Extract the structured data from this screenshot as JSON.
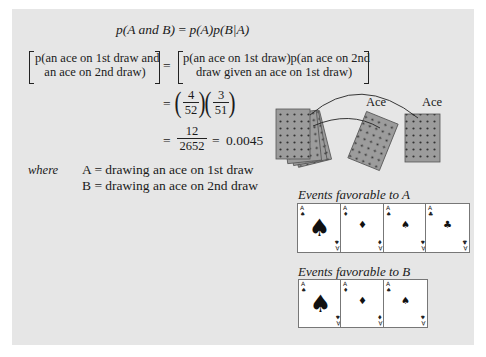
{
  "formula": {
    "general": {
      "lhs": "p(A and B)",
      "eq": "=",
      "rhs": "p(A)p(B|A)"
    },
    "bracketed": {
      "lhs_line1": "p(an ace on 1st draw and",
      "lhs_line2": "an ace on 2nd draw)",
      "eq": "=",
      "rhs_line1": "p(an ace on 1st draw)p(an ace on 2nd",
      "rhs_line2": "draw given an ace on 1st draw)"
    },
    "step1": {
      "eq": "=",
      "frac1_num": "4",
      "frac1_den": "52",
      "frac2_num": "3",
      "frac2_den": "51"
    },
    "step2": {
      "eq": "=",
      "num": "12",
      "den": "2652",
      "eq2": "=",
      "result": "0.0045"
    }
  },
  "definitions": {
    "where_label": "where",
    "a_def": "A = drawing an ace on 1st draw",
    "b_def": "B = drawing an ace on 2nd draw"
  },
  "illustration": {
    "ace_label_1": "Ace",
    "ace_label_2": "Ace",
    "card_back_color": "#9a9a9a",
    "events_a_title": "Events favorable to A",
    "events_b_title": "Events favorable to B",
    "events_a_cards": [
      {
        "rank": "A",
        "suit": "♠",
        "suit_name": "spades",
        "big": true
      },
      {
        "rank": "A",
        "suit": "♦",
        "suit_name": "diamonds",
        "big": false
      },
      {
        "rank": "A",
        "suit": "♠",
        "suit_name": "spades-small",
        "big": false
      },
      {
        "rank": "A",
        "suit": "♣",
        "suit_name": "clubs",
        "big": false
      }
    ],
    "events_b_cards": [
      {
        "rank": "A",
        "suit": "♠",
        "suit_name": "spades",
        "big": true
      },
      {
        "rank": "A",
        "suit": "♦",
        "suit_name": "diamonds",
        "big": false
      },
      {
        "rank": "A",
        "suit": "♠",
        "suit_name": "spades-small",
        "big": false
      }
    ]
  }
}
